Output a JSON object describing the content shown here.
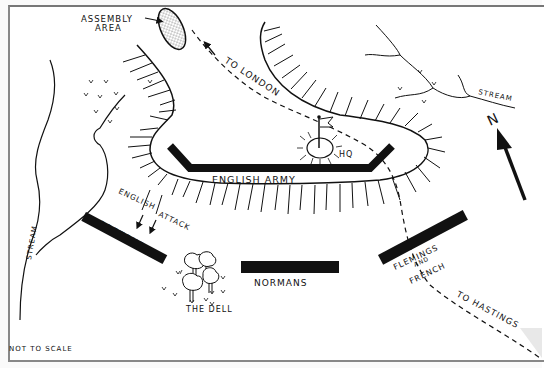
{
  "map": {
    "title": "Battle of Hastings deployment sketch map",
    "labels": {
      "assembly_area": [
        "ASSEMBLY",
        "AREA"
      ],
      "to_london": "TO LONDON",
      "stream_ne": "STREAM",
      "stream_w": "STREAM",
      "north": "N",
      "hq": "HQ",
      "english_army": "ENGLISH ARMY",
      "english_attack": [
        "ENGLISH",
        "ATTACK"
      ],
      "bretons": "BRETONS",
      "normans": "NORMANS",
      "flemings": [
        "FLEMINGS",
        "AND",
        "FRENCH"
      ],
      "to_hastings": "TO HASTINGS",
      "the_dell": "THE DELL",
      "scale_note": "NOT TO SCALE"
    },
    "colors": {
      "ink": "#111111",
      "paper": "#ffffff",
      "border": "#808080"
    }
  }
}
